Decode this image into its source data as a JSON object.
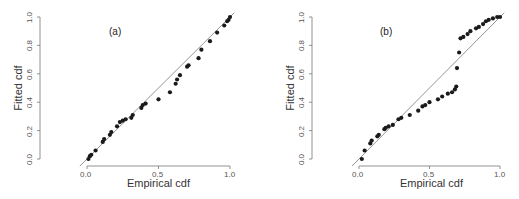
{
  "chart_data": [
    {
      "type": "scatter",
      "title": "(a)",
      "xlabel": "Empirical cdf",
      "ylabel": "Fitted cdf",
      "xlim": [
        0,
        1
      ],
      "ylim": [
        0,
        1
      ],
      "xticks": [
        "0.0",
        "0.5",
        "1.0"
      ],
      "yticks": [
        "0.0",
        "0.2",
        "0.4",
        "0.6",
        "0.8",
        "1.0"
      ],
      "reference_line": "y = x",
      "grid": false,
      "points": [
        [
          0.01,
          0.0
        ],
        [
          0.02,
          0.02
        ],
        [
          0.03,
          0.03
        ],
        [
          0.06,
          0.06
        ],
        [
          0.11,
          0.12
        ],
        [
          0.12,
          0.14
        ],
        [
          0.16,
          0.17
        ],
        [
          0.17,
          0.19
        ],
        [
          0.21,
          0.23
        ],
        [
          0.23,
          0.26
        ],
        [
          0.25,
          0.27
        ],
        [
          0.27,
          0.28
        ],
        [
          0.31,
          0.29
        ],
        [
          0.32,
          0.31
        ],
        [
          0.38,
          0.36
        ],
        [
          0.39,
          0.38
        ],
        [
          0.41,
          0.39
        ],
        [
          0.5,
          0.42
        ],
        [
          0.58,
          0.47
        ],
        [
          0.62,
          0.53
        ],
        [
          0.63,
          0.56
        ],
        [
          0.65,
          0.59
        ],
        [
          0.7,
          0.65
        ],
        [
          0.71,
          0.66
        ],
        [
          0.78,
          0.71
        ],
        [
          0.8,
          0.77
        ],
        [
          0.86,
          0.83
        ],
        [
          0.91,
          0.89
        ],
        [
          0.96,
          0.94
        ],
        [
          0.98,
          0.97
        ],
        [
          0.99,
          0.98
        ],
        [
          1.0,
          1.0
        ]
      ]
    },
    {
      "type": "scatter",
      "title": "(b)",
      "xlabel": "Empirical cdf",
      "ylabel": "Fitted cdf",
      "xlim": [
        0,
        1
      ],
      "ylim": [
        0,
        1
      ],
      "xticks": [
        "0.0",
        "0.5",
        "1.0"
      ],
      "yticks": [
        "0.0",
        "0.2",
        "0.4",
        "0.6",
        "0.8",
        "1.0"
      ],
      "reference_line": "y = x",
      "grid": false,
      "points": [
        [
          0.02,
          0.0
        ],
        [
          0.04,
          0.06
        ],
        [
          0.08,
          0.11
        ],
        [
          0.09,
          0.13
        ],
        [
          0.13,
          0.16
        ],
        [
          0.14,
          0.17
        ],
        [
          0.18,
          0.21
        ],
        [
          0.19,
          0.22
        ],
        [
          0.21,
          0.23
        ],
        [
          0.24,
          0.24
        ],
        [
          0.28,
          0.28
        ],
        [
          0.3,
          0.29
        ],
        [
          0.36,
          0.31
        ],
        [
          0.42,
          0.34
        ],
        [
          0.45,
          0.37
        ],
        [
          0.47,
          0.38
        ],
        [
          0.5,
          0.4
        ],
        [
          0.56,
          0.42
        ],
        [
          0.59,
          0.44
        ],
        [
          0.63,
          0.46
        ],
        [
          0.66,
          0.47
        ],
        [
          0.68,
          0.49
        ],
        [
          0.69,
          0.51
        ],
        [
          0.695,
          0.64
        ],
        [
          0.71,
          0.75
        ],
        [
          0.72,
          0.85
        ],
        [
          0.74,
          0.86
        ],
        [
          0.77,
          0.88
        ],
        [
          0.79,
          0.9
        ],
        [
          0.83,
          0.92
        ],
        [
          0.85,
          0.93
        ],
        [
          0.88,
          0.95
        ],
        [
          0.9,
          0.97
        ],
        [
          0.92,
          0.98
        ],
        [
          0.95,
          0.99
        ],
        [
          0.98,
          1.0
        ],
        [
          1.0,
          1.0
        ]
      ]
    }
  ],
  "panels": [
    {
      "tag": "(a)",
      "xlabel": "Empirical cdf",
      "ylabel": "Fitted cdf",
      "xticks": [
        "0.0",
        "0.5",
        "1.0"
      ],
      "yticks": [
        "0.0",
        "0.2",
        "0.4",
        "0.6",
        "0.8",
        "1.0"
      ]
    },
    {
      "tag": "(b)",
      "xlabel": "Empirical cdf",
      "ylabel": "Fitted cdf",
      "xticks": [
        "0.0",
        "0.5",
        "1.0"
      ],
      "yticks": [
        "0.0",
        "0.2",
        "0.4",
        "0.6",
        "0.8",
        "1.0"
      ]
    }
  ],
  "colors": {
    "points": "#1a1a1a",
    "axis": "#777777",
    "line": "#888888"
  }
}
